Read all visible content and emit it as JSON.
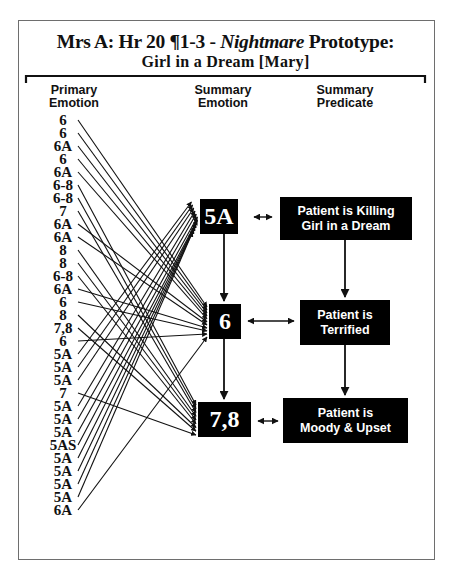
{
  "title": {
    "line1_prefix": "Mrs A: Hr 20 ¶1-3 - ",
    "line1_italic": "Nightmare",
    "line1_suffix": " Prototype:",
    "line2": "Girl in a Dream [Mary]"
  },
  "headers": {
    "primary": [
      "Primary",
      "Emotion"
    ],
    "summary_emotion": [
      "Summary",
      "Emotion"
    ],
    "summary_predicate": [
      "Summary",
      "Predicate"
    ]
  },
  "primary_emotions": [
    {
      "label": "6",
      "target": "6"
    },
    {
      "label": "6",
      "target": "6"
    },
    {
      "label": "6A",
      "target": "6"
    },
    {
      "label": "6",
      "target": "6"
    },
    {
      "label": "6A",
      "target": "6"
    },
    {
      "label": "6-8",
      "target": "7,8"
    },
    {
      "label": "6-8",
      "target": "7,8"
    },
    {
      "label": "7",
      "target": "7,8"
    },
    {
      "label": "6A",
      "target": "6"
    },
    {
      "label": "6A",
      "target": "6"
    },
    {
      "label": "8",
      "target": "7,8"
    },
    {
      "label": "8",
      "target": "7,8"
    },
    {
      "label": "6-8",
      "target": "7,8"
    },
    {
      "label": "6A",
      "target": "6"
    },
    {
      "label": "6",
      "target": "6"
    },
    {
      "label": "8",
      "target": "7,8"
    },
    {
      "label": "7,8",
      "target": "7,8"
    },
    {
      "label": "6",
      "target": "6"
    },
    {
      "label": "5A",
      "target": "5A"
    },
    {
      "label": "5A",
      "target": "5A"
    },
    {
      "label": "5A",
      "target": "5A"
    },
    {
      "label": "7",
      "target": "7,8"
    },
    {
      "label": "5A",
      "target": "5A"
    },
    {
      "label": "5A",
      "target": "5A"
    },
    {
      "label": "5A",
      "target": "5A"
    },
    {
      "label": "5AS",
      "target": "5A"
    },
    {
      "label": "5A",
      "target": "5A"
    },
    {
      "label": "5A",
      "target": "5A"
    },
    {
      "label": "5A",
      "target": "5A"
    },
    {
      "label": "5A",
      "target": "5A"
    },
    {
      "label": "6A",
      "target": "6"
    }
  ],
  "summary": [
    {
      "emotion": "5A",
      "predicate": [
        "Patient is Killing",
        "Girl in a Dream"
      ]
    },
    {
      "emotion": "6",
      "predicate": [
        "Patient is",
        "Terrified"
      ]
    },
    {
      "emotion": "7,8",
      "predicate": [
        "Patient is",
        "Moody & Upset"
      ]
    }
  ],
  "colors": {
    "box_fill": "#000000",
    "box_text": "#ffffff",
    "line": "#111111",
    "frame": "#6e6e6e"
  }
}
